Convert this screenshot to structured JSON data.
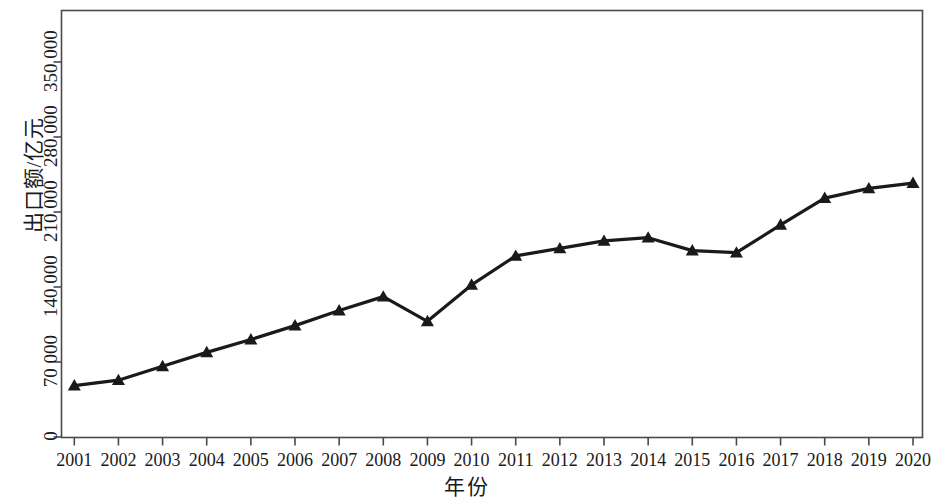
{
  "chart_data": {
    "type": "line",
    "title": "",
    "xlabel": "年份",
    "ylabel": "出口额/亿元",
    "categories": [
      "2001",
      "2002",
      "2003",
      "2004",
      "2005",
      "2006",
      "2007",
      "2008",
      "2009",
      "2010",
      "2011",
      "2012",
      "2013",
      "2014",
      "2015",
      "2016",
      "2017",
      "2018",
      "2019",
      "2020"
    ],
    "values": [
      48000,
      53000,
      66000,
      79000,
      91000,
      104000,
      118000,
      131000,
      108000,
      142000,
      169000,
      176000,
      183000,
      186000,
      174000,
      172000,
      198000,
      223000,
      232000,
      237000
    ],
    "series": [
      {
        "name": "出口额",
        "marker": "triangle",
        "color": "#1a1a1a",
        "values": [
          48000,
          53000,
          66000,
          79000,
          91000,
          104000,
          118000,
          131000,
          108000,
          142000,
          169000,
          176000,
          183000,
          186000,
          174000,
          172000,
          198000,
          223000,
          232000,
          237000
        ]
      }
    ],
    "x_tick_labels": [
      "2001",
      "2002",
      "2003",
      "2004",
      "2005",
      "2006",
      "2007",
      "2008",
      "2009",
      "2010",
      "2011",
      "2012",
      "2013",
      "2014",
      "2015",
      "2016",
      "2017",
      "2018",
      "2019",
      "2020"
    ],
    "y_tick_labels": [
      "0",
      "70 000",
      "140 000",
      "210 000",
      "280 000",
      "350 000"
    ],
    "y_tick_values": [
      0,
      70000,
      140000,
      210000,
      280000,
      350000
    ],
    "ylim": [
      0,
      350000
    ],
    "grid": false,
    "legend": false,
    "legend_position": "none",
    "axis_color": "#4a4a4a",
    "line_color": "#1a1a1a",
    "background": "#ffffff"
  },
  "axes": {
    "y_axis_title": "出口额/亿元",
    "x_axis_title": "年份"
  }
}
